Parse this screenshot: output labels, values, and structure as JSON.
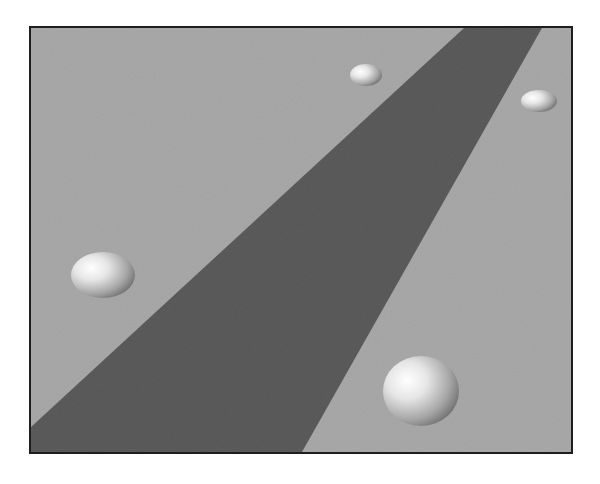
{
  "scene": {
    "title": "Rendered scene: spheres on a plane with a shadow band",
    "colors": {
      "ground": "#a9a9a9",
      "shadow_band": "#5b5b5b",
      "frame_border": "#1e1e1e",
      "page_background": "#ffffff",
      "sphere_highlight": "#ffffff",
      "sphere_mid": "#d2d2d2",
      "sphere_shade": "#7a7a7a"
    },
    "band": {
      "points": "433,0 511,0 271,428 0,428 0,401"
    },
    "spheres": [
      {
        "name": "large-front-sphere",
        "cx": 390,
        "cy": 363,
        "rx": 38,
        "ry": 35
      },
      {
        "name": "left-sphere",
        "cx": 72,
        "cy": 247,
        "rx": 32,
        "ry": 23
      },
      {
        "name": "small-top-middle-sphere",
        "cx": 335,
        "cy": 47,
        "rx": 16,
        "ry": 11
      },
      {
        "name": "small-top-right-sphere",
        "cx": 508,
        "cy": 73,
        "rx": 18,
        "ry": 11
      }
    ]
  }
}
